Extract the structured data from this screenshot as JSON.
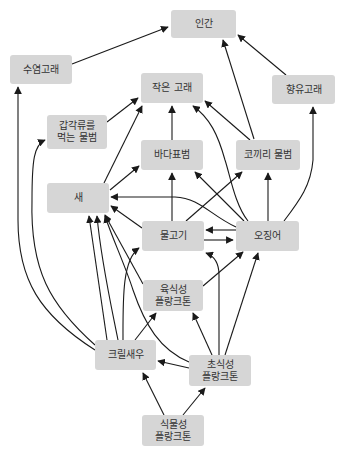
{
  "diagram": {
    "type": "food-web",
    "colors": {
      "node_fill": "#d6d6d6",
      "node_text": "#333333",
      "edge": "#1a1a1a",
      "background": "#ffffff"
    },
    "nodes": [
      {
        "id": "human",
        "label": "인간",
        "x": 171,
        "y": 10,
        "w": 65,
        "h": 28
      },
      {
        "id": "baleen",
        "label": "수염고래",
        "x": 10,
        "y": 55,
        "w": 62,
        "h": 29
      },
      {
        "id": "sperm",
        "label": "향유고래",
        "x": 272,
        "y": 75,
        "w": 63,
        "h": 29
      },
      {
        "id": "smallwhale",
        "label": "작은 고래",
        "x": 141,
        "y": 73,
        "w": 62,
        "h": 30
      },
      {
        "id": "crabeater",
        "label": "갑각류를\n먹는 물범",
        "x": 47,
        "y": 115,
        "w": 60,
        "h": 34
      },
      {
        "id": "leopard",
        "label": "바다표범",
        "x": 141,
        "y": 140,
        "w": 62,
        "h": 30
      },
      {
        "id": "elephant",
        "label": "코끼리 물범",
        "x": 236,
        "y": 140,
        "w": 64,
        "h": 30
      },
      {
        "id": "bird",
        "label": "새",
        "x": 47,
        "y": 183,
        "w": 62,
        "h": 30
      },
      {
        "id": "fish",
        "label": "물고기",
        "x": 142,
        "y": 221,
        "w": 62,
        "h": 30
      },
      {
        "id": "squid",
        "label": "오징어",
        "x": 236,
        "y": 221,
        "w": 63,
        "h": 30
      },
      {
        "id": "carnplank",
        "label": "육식성\n플랑크톤",
        "x": 143,
        "y": 280,
        "w": 60,
        "h": 31
      },
      {
        "id": "krill",
        "label": "크릴새우",
        "x": 95,
        "y": 340,
        "w": 61,
        "h": 30
      },
      {
        "id": "herbplank",
        "label": "초식성\n플랑크톤",
        "x": 189,
        "y": 355,
        "w": 62,
        "h": 31
      },
      {
        "id": "phytoplank",
        "label": "식물성\n플랑크톤",
        "x": 142,
        "y": 415,
        "w": 62,
        "h": 31
      }
    ],
    "edges": [
      {
        "from": "baleen",
        "to": "human",
        "d": "M72,64 L168,27"
      },
      {
        "from": "smallwhale",
        "to": "human",
        "d": "M254,139 L223,40"
      },
      {
        "from": "sperm",
        "to": "human",
        "d": "M286,75 L238,35"
      },
      {
        "from": "crabeater",
        "to": "smallwhale",
        "d": "M107,122 L138,98"
      },
      {
        "from": "leopard",
        "to": "smallwhale",
        "d": "M172,140 L172,106"
      },
      {
        "from": "elephant",
        "to": "smallwhale",
        "d": "M250,140 L205,101"
      },
      {
        "from": "bird",
        "to": "smallwhale",
        "d": "M104,183 L142,106"
      },
      {
        "from": "squid",
        "to": "smallwhale",
        "d": "M248,221 C235,205 230,175 225,160 C218,135 210,118 193,106"
      },
      {
        "from": "bird",
        "to": "leopard",
        "d": "M110,190 L139,166"
      },
      {
        "from": "fish",
        "to": "leopard",
        "d": "M172,221 L172,173"
      },
      {
        "from": "squid",
        "to": "leopard",
        "d": "M244,221 L195,172"
      },
      {
        "from": "fish",
        "to": "elephant",
        "d": "M186,221 L242,172"
      },
      {
        "from": "squid",
        "to": "elephant",
        "d": "M268,221 L268,173"
      },
      {
        "from": "squid",
        "to": "sperm",
        "d": "M284,221 C300,200 311,185 313,160 L313,107"
      },
      {
        "from": "squid",
        "to": "bird",
        "d": "M236,227 C210,215 200,198 175,197 L111,197"
      },
      {
        "from": "fish",
        "to": "bird",
        "d": "M142,228 L111,206"
      },
      {
        "from": "squid",
        "to": "fish",
        "d": "M236,230 L206,230"
      },
      {
        "from": "fish",
        "to": "squid",
        "d": "M204,240 L233,240"
      },
      {
        "from": "carnplank",
        "to": "bird",
        "d": "M143,284 L105,215"
      },
      {
        "from": "carnplank",
        "to": "squid",
        "d": "M203,286 L243,252"
      },
      {
        "from": "krill",
        "to": "bird",
        "d": "M107,340 L89,216"
      },
      {
        "from": "krill",
        "to": "bird",
        "d": "M118,340 C110,300 101,260 97,216"
      },
      {
        "from": "herbplank",
        "to": "bird",
        "d": "M189,362 C160,350 145,325 133,290 C125,265 113,240 105,216"
      },
      {
        "from": "krill",
        "to": "fish",
        "d": "M123,340 C123,300 122,260 139,248"
      },
      {
        "from": "krill",
        "to": "crabeater",
        "d": "M95,345 C50,305 30,270 32,200 C32,160 34,145 45,140"
      },
      {
        "from": "krill",
        "to": "baleen",
        "d": "M95,350 C40,315 18,280 18,220 L18,87"
      },
      {
        "from": "krill",
        "to": "carnplank",
        "d": "M135,340 L156,313"
      },
      {
        "from": "herbplank",
        "to": "carnplank",
        "d": "M212,355 L193,313"
      },
      {
        "from": "herbplank",
        "to": "fish",
        "d": "M219,355 L219,275 C219,262 214,256 206,253"
      },
      {
        "from": "herbplank",
        "to": "squid",
        "d": "M225,355 L258,253"
      },
      {
        "from": "herbplank",
        "to": "krill",
        "d": "M189,368 L158,361"
      },
      {
        "from": "phytoplank",
        "to": "krill",
        "d": "M164,415 L143,373"
      },
      {
        "from": "phytoplank",
        "to": "herbplank",
        "d": "M183,415 L205,388"
      }
    ]
  }
}
